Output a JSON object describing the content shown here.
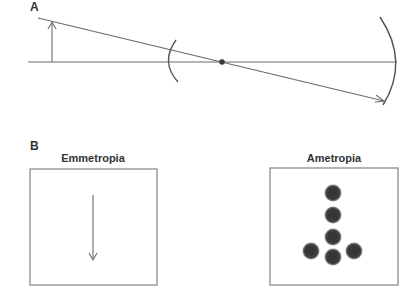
{
  "panel_a": {
    "label": "A",
    "elements": [
      "object-arrow",
      "optical-axis",
      "chief-ray",
      "cornea-arc",
      "nodal-point",
      "retina-arc"
    ]
  },
  "panel_b": {
    "label": "B",
    "left_box": {
      "title": "Emmetropia",
      "content": "sharp-image-arrow"
    },
    "right_box": {
      "title": "Ametropia",
      "content": "blurred-image-arrow-of-blur-circles"
    }
  },
  "colors": {
    "line": "#6b6b6b",
    "dot": "#3a3a3a",
    "box_border": "#777777",
    "text": "#333333"
  }
}
